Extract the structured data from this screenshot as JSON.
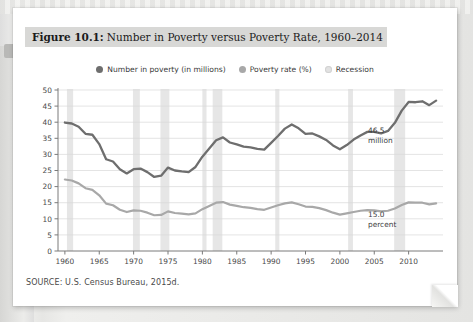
{
  "figure": {
    "number_label": "Figure 10.1:",
    "title": "Number in Poverty versus Poverty Rate, 1960–2014",
    "source": "SOURCE: U.S. Census Bureau, 2015d."
  },
  "legend": {
    "items": [
      {
        "label": "Number in poverty (in millions)",
        "color": "#6e6e6e",
        "icon": "legend-dot-icon"
      },
      {
        "label": "Poverty rate (%)",
        "color": "#a8a8a8",
        "icon": "legend-dot-icon"
      },
      {
        "label": "Recession",
        "color": "#e2e2e2",
        "icon": "legend-dot-icon"
      }
    ]
  },
  "annotations": {
    "number_value": "46.5",
    "number_unit": "million",
    "rate_value": "15.0",
    "rate_unit": "percent"
  },
  "chart_data": {
    "type": "line",
    "title": "Number in Poverty versus Poverty Rate, 1960–2014",
    "xlabel": "",
    "ylabel": "",
    "xlim": [
      1959,
      2015
    ],
    "ylim": [
      0,
      50
    ],
    "grid": true,
    "legend_position": "top-center",
    "x_tick_labels": [
      "1960",
      "1965",
      "1970",
      "1975",
      "1980",
      "1985",
      "1990",
      "1995",
      "2000",
      "2005",
      "2010"
    ],
    "x_ticks": [
      1960,
      1965,
      1970,
      1975,
      1980,
      1985,
      1990,
      1995,
      2000,
      2005,
      2010
    ],
    "y_tick_labels": [
      "0",
      "5",
      "10",
      "15",
      "20",
      "25",
      "30",
      "35",
      "40",
      "45",
      "50"
    ],
    "y_ticks": [
      0,
      5,
      10,
      15,
      20,
      25,
      30,
      35,
      40,
      45,
      50
    ],
    "x": [
      1960,
      1961,
      1962,
      1963,
      1964,
      1965,
      1966,
      1967,
      1968,
      1969,
      1970,
      1971,
      1972,
      1973,
      1974,
      1975,
      1976,
      1977,
      1978,
      1979,
      1980,
      1981,
      1982,
      1983,
      1984,
      1985,
      1986,
      1987,
      1988,
      1989,
      1990,
      1991,
      1992,
      1993,
      1994,
      1995,
      1996,
      1997,
      1998,
      1999,
      2000,
      2001,
      2002,
      2003,
      2004,
      2005,
      2006,
      2007,
      2008,
      2009,
      2010,
      2011,
      2012,
      2013,
      2014
    ],
    "series": [
      {
        "name": "Number in poverty (in millions)",
        "color": "#6e6e6e",
        "values": [
          39.9,
          39.6,
          38.6,
          36.4,
          36.1,
          33.2,
          28.5,
          27.8,
          25.4,
          24.1,
          25.4,
          25.6,
          24.5,
          23.0,
          23.4,
          25.9,
          25.0,
          24.7,
          24.5,
          26.1,
          29.3,
          31.8,
          34.4,
          35.3,
          33.7,
          33.1,
          32.4,
          32.2,
          31.7,
          31.5,
          33.6,
          35.7,
          38.0,
          39.3,
          38.1,
          36.4,
          36.5,
          35.6,
          34.5,
          32.8,
          31.6,
          32.9,
          34.6,
          35.9,
          37.0,
          37.0,
          36.5,
          37.3,
          39.8,
          43.6,
          46.3,
          46.2,
          46.5,
          45.3,
          46.7
        ]
      },
      {
        "name": "Poverty rate (%)",
        "color": "#a8a8a8",
        "values": [
          22.2,
          21.9,
          21.0,
          19.5,
          19.0,
          17.3,
          14.7,
          14.2,
          12.8,
          12.1,
          12.6,
          12.5,
          11.9,
          11.1,
          11.2,
          12.3,
          11.8,
          11.6,
          11.4,
          11.7,
          13.0,
          14.0,
          15.0,
          15.2,
          14.4,
          14.0,
          13.6,
          13.4,
          13.0,
          12.8,
          13.5,
          14.2,
          14.8,
          15.1,
          14.5,
          13.8,
          13.7,
          13.3,
          12.7,
          11.9,
          11.3,
          11.7,
          12.1,
          12.5,
          12.7,
          12.6,
          12.3,
          12.5,
          13.2,
          14.3,
          15.1,
          15.0,
          15.0,
          14.5,
          14.8
        ]
      }
    ],
    "recessions": [
      {
        "start": 1960.3,
        "end": 1961.2
      },
      {
        "start": 1969.9,
        "end": 1970.9
      },
      {
        "start": 1973.9,
        "end": 1975.2
      },
      {
        "start": 1980.0,
        "end": 1980.6
      },
      {
        "start": 1981.5,
        "end": 1982.9
      },
      {
        "start": 1990.6,
        "end": 1991.2
      },
      {
        "start": 2001.2,
        "end": 2001.9
      },
      {
        "start": 2007.9,
        "end": 2009.5
      }
    ]
  }
}
